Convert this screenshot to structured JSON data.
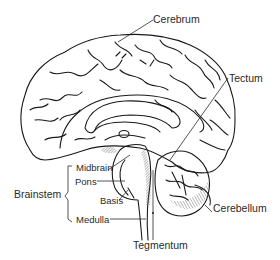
{
  "diagram": {
    "colors": {
      "line": "#1a1a1a",
      "text": "#2a2a2a",
      "shade": "#9a9a9a",
      "background": "#ffffff"
    },
    "labels": {
      "cerebrum": "Cerebrum",
      "tectum": "Tectum",
      "midbrain": "Midbrain",
      "pons": "Pons",
      "basis": "Basis",
      "brainstem": "Brainstem",
      "medulla": "Medulla",
      "cerebellum": "Cerebellum",
      "tegmentum": "Tegmentum"
    }
  }
}
